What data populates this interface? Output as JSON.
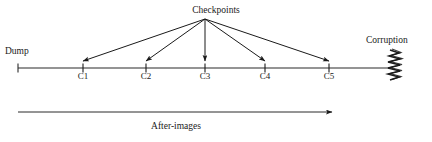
{
  "diagram": {
    "labels": {
      "checkpoints": "Checkpoints",
      "dump": "Dump",
      "corruption": "Corruption",
      "after_images": "After-images"
    },
    "checkpoint_ticks": [
      {
        "id": "c1",
        "label": "C1",
        "x": 83
      },
      {
        "id": "c2",
        "label": "C2",
        "x": 146
      },
      {
        "id": "c3",
        "label": "C3",
        "x": 205
      },
      {
        "id": "c4",
        "label": "C4",
        "x": 265
      },
      {
        "id": "c5",
        "label": "C5",
        "x": 329
      }
    ],
    "timeline": {
      "start_x": 18,
      "end_x": 393,
      "y": 68,
      "dump_tick_x": 18
    },
    "arrow_origin": {
      "x": 205,
      "y": 19
    },
    "after_images_arrow": {
      "start_x": 18,
      "end_x": 332,
      "y": 112
    },
    "colors": {
      "ink": "#1a1a1a",
      "line": "#333333",
      "background": "#ffffff"
    }
  }
}
